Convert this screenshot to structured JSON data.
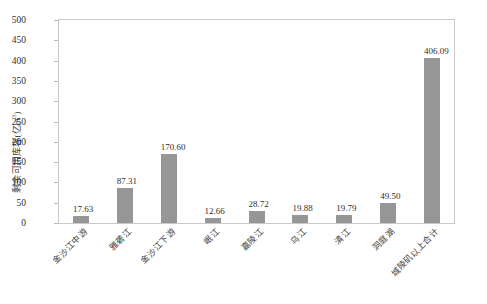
{
  "chart_data": {
    "type": "bar",
    "title": "",
    "xlabel": "",
    "ylabel": "剩余可用库容(亿m³)",
    "ylabel_main": "剩余可用库容(亿m",
    "ylabel_sup": "3",
    "ylabel_tail": ")",
    "ylim": [
      0,
      500
    ],
    "yticks": [
      500,
      450,
      400,
      350,
      300,
      250,
      200,
      150,
      100,
      50,
      0
    ],
    "ytick_labels": [
      "500",
      "450",
      "400",
      "350",
      "300",
      "250",
      "200",
      "150",
      "100",
      "50",
      "0"
    ],
    "grid": false,
    "legend": "none",
    "bar_color": "#969696",
    "categories": [
      "金沙江中游",
      "雅砻江",
      "金沙江下游",
      "岷江",
      "嘉陵江",
      "乌江",
      "清江",
      "洞庭湖",
      "城陵矶以上合计"
    ],
    "values": [
      17.63,
      87.31,
      170.6,
      12.66,
      28.72,
      19.88,
      19.79,
      49.5,
      406.09
    ],
    "value_labels": [
      "17.63",
      "87.31",
      "170.60",
      "12.66",
      "28.72",
      "19.88",
      "19.79",
      "49.50",
      "406.09"
    ]
  }
}
